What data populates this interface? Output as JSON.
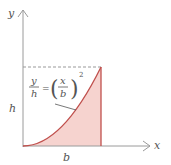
{
  "diagram": {
    "type": "area-under-parabola",
    "axes": {
      "x_label": "x",
      "y_label": "y"
    },
    "dimension_labels": {
      "height": "h",
      "base": "b"
    },
    "equation": {
      "lhs_num": "y",
      "lhs_den": "h",
      "equals": "=",
      "rhs_num": "x",
      "rhs_den": "b",
      "exponent": "2"
    },
    "colors": {
      "axis": "#9a9a9a",
      "curve": "#c0504d",
      "fill": "#f6d3cf",
      "dashed": "#999999",
      "text": "#555555"
    }
  }
}
